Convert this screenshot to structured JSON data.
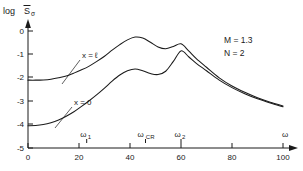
{
  "figure": {
    "y_axis_label": "log",
    "y_axis_symbol": "S",
    "y_axis_subscript": "σ",
    "x_axis_label": "ω"
  },
  "annotations": {
    "param_m": "M = 1.3",
    "param_n": "N = 2",
    "curve_upper": "x = ℓ",
    "curve_lower": "x = 0",
    "omega1_base": "ω",
    "omega1_sub": "1",
    "omegacr_base": "ω",
    "omegacr_sub": "CR",
    "omega2_base": "ω",
    "omega2_sub": "2"
  },
  "axis_ticks": {
    "x": [
      "0",
      "20",
      "40",
      "60",
      "80",
      "100"
    ],
    "y": [
      "0",
      "-1",
      "-2",
      "-3",
      "-4",
      "-5"
    ]
  },
  "chart_data": {
    "type": "line",
    "title": "",
    "xlabel": "ω",
    "ylabel": "log S̅σ",
    "xlim": [
      0,
      100
    ],
    "ylim": [
      -5,
      0.3
    ],
    "grid": false,
    "legend": "inline-curve-labels",
    "annotations_text": [
      "M = 1.3",
      "N = 2"
    ],
    "special_frequencies": [
      {
        "name": "ω₁",
        "value": 23
      },
      {
        "name": "ω_CR",
        "value": 46
      },
      {
        "name": "ω₂",
        "value": 60
      }
    ],
    "series": [
      {
        "name": "x = ℓ",
        "x": [
          0,
          3,
          6,
          9,
          12,
          15,
          18,
          21,
          24,
          27,
          30,
          33,
          36,
          39,
          42,
          45,
          48,
          51,
          54,
          57,
          60,
          63,
          66,
          70,
          75,
          80,
          85,
          90,
          95,
          100
        ],
        "values": [
          -2.1,
          -2.1,
          -2.09,
          -2.06,
          -2.0,
          -1.92,
          -1.8,
          -1.66,
          -1.5,
          -1.3,
          -1.08,
          -0.82,
          -0.58,
          -0.38,
          -0.26,
          -0.3,
          -0.48,
          -0.68,
          -0.76,
          -0.66,
          -0.55,
          -0.85,
          -1.18,
          -1.55,
          -2.0,
          -2.35,
          -2.62,
          -2.85,
          -3.04,
          -3.2
        ]
      },
      {
        "name": "x = 0",
        "x": [
          0,
          3,
          6,
          9,
          12,
          15,
          18,
          21,
          24,
          27,
          30,
          33,
          36,
          39,
          42,
          45,
          48,
          51,
          54,
          57,
          60,
          63,
          66,
          70,
          75,
          80,
          85,
          90,
          95,
          100
        ],
        "values": [
          -4.05,
          -4.04,
          -4.0,
          -3.92,
          -3.8,
          -3.64,
          -3.45,
          -3.22,
          -2.98,
          -2.72,
          -2.44,
          -2.14,
          -1.88,
          -1.7,
          -1.62,
          -1.7,
          -1.82,
          -1.86,
          -1.72,
          -1.3,
          -0.85,
          -1.1,
          -1.38,
          -1.7,
          -2.1,
          -2.42,
          -2.68,
          -2.9,
          -3.08,
          -3.24
        ]
      }
    ]
  }
}
